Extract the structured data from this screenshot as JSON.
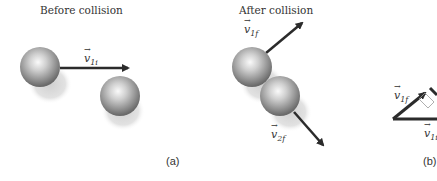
{
  "panels": [
    {
      "id": "a",
      "title": "Before collision",
      "label": "(a)",
      "vectors": [
        {
          "symbol": "v",
          "subscript": "1i"
        }
      ]
    },
    {
      "id": "b-left",
      "title": "After collision",
      "vectors": [
        {
          "symbol": "v",
          "subscript": "1f"
        },
        {
          "symbol": "v",
          "subscript": "2f"
        }
      ]
    },
    {
      "id": "b",
      "label": "(b)",
      "vectors": [
        {
          "symbol": "v",
          "subscript": "1f"
        },
        {
          "symbol": "v",
          "subscript": "1i"
        }
      ]
    }
  ],
  "colors": {
    "arrow": "#2b2b2b",
    "sphere_light": "#f2f2f2",
    "sphere_dark": "#6e6e6e",
    "shadow": "#d8d8d8"
  }
}
